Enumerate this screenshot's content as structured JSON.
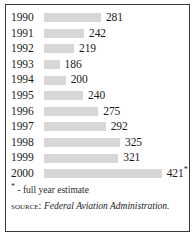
{
  "figure": {
    "footnote_marker": "*",
    "footnote_text": " - full year estimate",
    "source_label": "Source:",
    "source_value": "Federal Aviation Administration."
  },
  "chart_data": {
    "type": "bar",
    "orientation": "horizontal",
    "title": "",
    "subtitle": "",
    "xlabel": "",
    "ylabel": "",
    "grid": false,
    "legend": false,
    "axis_visible": false,
    "value_labels": true,
    "bar_color": "#d7d7d7",
    "baseline_value": 150,
    "xlim": [
      150,
      440
    ],
    "categories": [
      "1990",
      "1991",
      "1992",
      "1993",
      "1994",
      "1995",
      "1996",
      "1997",
      "1998",
      "1999",
      "2000"
    ],
    "values": [
      281,
      242,
      219,
      186,
      200,
      240,
      275,
      292,
      325,
      321,
      421
    ],
    "value_suffixes": [
      "",
      "",
      "",
      "",
      "",
      "",
      "",
      "",
      "",
      "",
      "*"
    ],
    "annotations": [
      "* - full year estimate",
      "SOURCE: Federal Aviation Administration."
    ],
    "rows": [
      {
        "category": "1990",
        "value": 281,
        "label": "281",
        "suffix": ""
      },
      {
        "category": "1991",
        "value": 242,
        "label": "242",
        "suffix": ""
      },
      {
        "category": "1992",
        "value": 219,
        "label": "219",
        "suffix": ""
      },
      {
        "category": "1993",
        "value": 186,
        "label": "186",
        "suffix": ""
      },
      {
        "category": "1994",
        "value": 200,
        "label": "200",
        "suffix": ""
      },
      {
        "category": "1995",
        "value": 240,
        "label": "240",
        "suffix": ""
      },
      {
        "category": "1996",
        "value": 275,
        "label": "275",
        "suffix": ""
      },
      {
        "category": "1997",
        "value": 292,
        "label": "292",
        "suffix": ""
      },
      {
        "category": "1998",
        "value": 325,
        "label": "325",
        "suffix": ""
      },
      {
        "category": "1999",
        "value": 321,
        "label": "321",
        "suffix": ""
      },
      {
        "category": "2000",
        "value": 421,
        "label": "421",
        "suffix": "*"
      }
    ]
  }
}
